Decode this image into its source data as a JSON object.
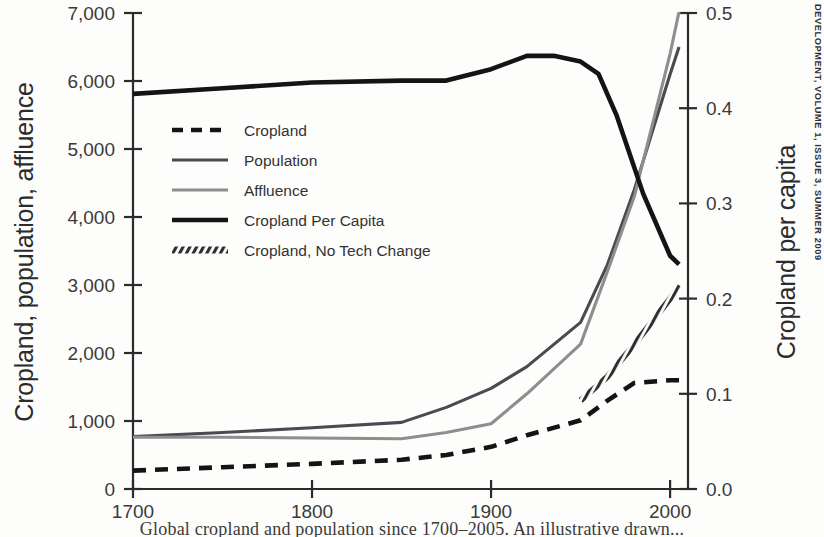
{
  "sidebar": {
    "journal_line": "DEVELOPMENT, VOLUME 1, ISSUE 3, SUMMER 2009"
  },
  "caption": {
    "text": "Global cropland and population since 1700–2005. An illustrative drawn..."
  },
  "chart_data": {
    "type": "line",
    "title": "",
    "xlabel": "",
    "ylabel": "Cropland, population, affluence",
    "y2label": "Cropland per capita",
    "xlim": [
      1700,
      2010
    ],
    "ylim": [
      0,
      7000
    ],
    "y2lim": [
      0.0,
      0.5
    ],
    "grid": false,
    "legend_position": "upper-left-inside",
    "x_ticks": [
      1700,
      1800,
      1900,
      2000
    ],
    "x_tick_labels": [
      "1700",
      "1800",
      "1900",
      "2000"
    ],
    "y_ticks": [
      0,
      1000,
      2000,
      3000,
      4000,
      5000,
      6000,
      7000
    ],
    "y_tick_labels": [
      "0",
      "1,000",
      "2,000",
      "3,000",
      "4,000",
      "5,000",
      "6,000",
      "7,000"
    ],
    "y2_ticks": [
      0.0,
      0.1,
      0.2,
      0.3,
      0.4,
      0.5
    ],
    "y2_tick_labels": [
      "0.0",
      "0.1",
      "0.2",
      "0.3",
      "0.4",
      "0.5"
    ],
    "series": [
      {
        "name": "Cropland",
        "axis": "left",
        "style": "dashed",
        "color": "#141414",
        "width": 4.6,
        "x": [
          1700,
          1750,
          1800,
          1850,
          1875,
          1900,
          1920,
          1950,
          1965,
          1980,
          2000,
          2005
        ],
        "values": [
          270,
          320,
          370,
          430,
          500,
          620,
          790,
          1010,
          1300,
          1560,
          1600,
          1600
        ]
      },
      {
        "name": "Population",
        "axis": "left",
        "style": "solid",
        "color": "#4a4a52",
        "width": 3.1,
        "x": [
          1700,
          1750,
          1800,
          1850,
          1875,
          1900,
          1920,
          1950,
          1965,
          1980,
          2000,
          2005
        ],
        "values": [
          770,
          830,
          900,
          980,
          1200,
          1480,
          1800,
          2450,
          3300,
          4400,
          6100,
          6500
        ]
      },
      {
        "name": "Affluence",
        "axis": "left",
        "style": "solid",
        "color": "#8e8e8e",
        "width": 3.1,
        "x": [
          1700,
          1750,
          1800,
          1850,
          1875,
          1900,
          1920,
          1950,
          1965,
          1980,
          2000,
          2005
        ],
        "values": [
          760,
          760,
          750,
          740,
          830,
          960,
          1400,
          2130,
          3200,
          4300,
          6400,
          7020
        ]
      },
      {
        "name": "Cropland Per Capita",
        "axis": "right",
        "style": "solid",
        "color": "#141414",
        "width": 4.6,
        "x": [
          1700,
          1750,
          1800,
          1850,
          1875,
          1900,
          1920,
          1935,
          1950,
          1960,
          1970,
          1985,
          2000,
          2005
        ],
        "values": [
          0.415,
          0.421,
          0.427,
          0.429,
          0.429,
          0.441,
          0.455,
          0.455,
          0.449,
          0.436,
          0.393,
          0.31,
          0.245,
          0.236
        ]
      },
      {
        "name": "Cropland, No Tech Change",
        "axis": "right",
        "style": "hatched",
        "color": "#2f2f2f",
        "width": 6.0,
        "x": [
          1950,
          1965,
          1980,
          2000,
          2005
        ],
        "values": [
          0.093,
          0.118,
          0.152,
          0.2,
          0.214
        ]
      }
    ],
    "legend": [
      {
        "label": "Cropland",
        "style": "dashed",
        "color": "#141414"
      },
      {
        "label": "Population",
        "style": "solid",
        "color": "#4a4a52"
      },
      {
        "label": "Affluence",
        "style": "solid",
        "color": "#8e8e8e"
      },
      {
        "label": "Cropland Per Capita",
        "style": "solid-thick",
        "color": "#141414"
      },
      {
        "label": "Cropland, No Tech Change",
        "style": "hatched",
        "color": "#2f2f2f"
      }
    ]
  }
}
